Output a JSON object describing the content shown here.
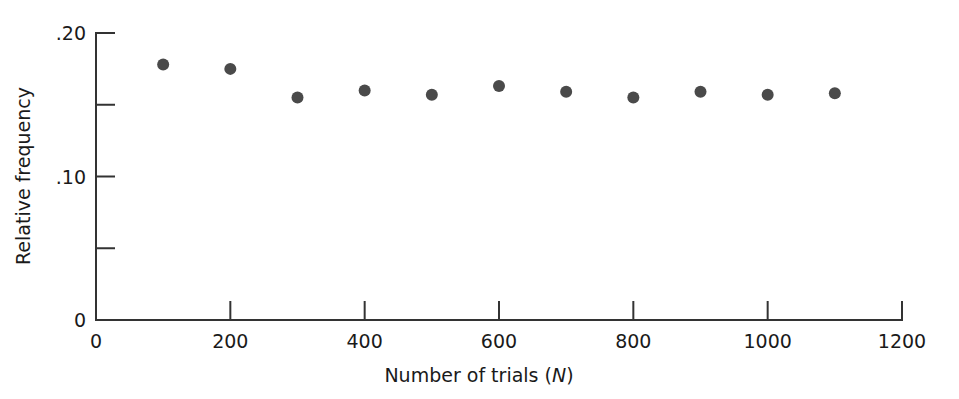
{
  "chart_data": {
    "type": "scatter",
    "title": "",
    "xlabel": "Number of trials (N)",
    "xlabel_plain": "Number of trials (",
    "xlabel_italic": "N",
    "xlabel_close": ")",
    "ylabel": "Relative frequency",
    "x": [
      100,
      200,
      300,
      400,
      500,
      600,
      700,
      800,
      900,
      1000,
      1100
    ],
    "values": [
      0.178,
      0.175,
      0.155,
      0.16,
      0.157,
      0.163,
      0.159,
      0.155,
      0.159,
      0.157,
      0.158
    ],
    "xlim": [
      0,
      1200
    ],
    "ylim": [
      0,
      0.2
    ],
    "grid": false,
    "legend": "none",
    "marker_color": "#4a4a4a",
    "axis_color": "#333333",
    "background_color": "#ffffff",
    "xticks": [
      {
        "value": 0,
        "label": "0",
        "major": true
      },
      {
        "value": 200,
        "label": "200",
        "major": true
      },
      {
        "value": 400,
        "label": "400",
        "major": true
      },
      {
        "value": 600,
        "label": "600",
        "major": true
      },
      {
        "value": 800,
        "label": "800",
        "major": true
      },
      {
        "value": 1000,
        "label": "1000",
        "major": true
      },
      {
        "value": 1200,
        "label": "1200",
        "major": true
      }
    ],
    "yticks": [
      {
        "value": 0,
        "label": "0",
        "major": true
      },
      {
        "value": 0.05,
        "label": "",
        "major": false
      },
      {
        "value": 0.1,
        "label": ".10",
        "major": true
      },
      {
        "value": 0.15,
        "label": "",
        "major": false
      },
      {
        "value": 0.2,
        "label": ".20",
        "major": true
      }
    ]
  }
}
